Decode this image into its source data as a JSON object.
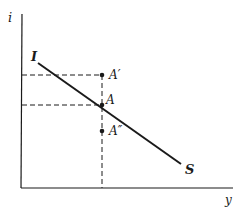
{
  "diagram": {
    "axes": {
      "y_label": "i",
      "x_label": "y"
    },
    "curve": {
      "start_label": "I",
      "end_label": "S"
    },
    "points": [
      {
        "id": "A_prime",
        "label": "A′"
      },
      {
        "id": "A",
        "label": "A"
      },
      {
        "id": "A_double_prime",
        "label": "A″"
      }
    ],
    "colors": {
      "ink": "#1a1a1a",
      "background": "#ffffff"
    }
  }
}
